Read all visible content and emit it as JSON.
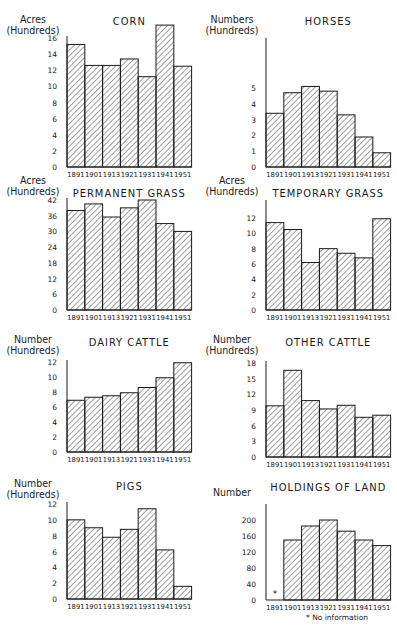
{
  "chart_data": [
    {
      "id": "corn",
      "type": "bar",
      "title": "CORN",
      "ylabel": [
        "Acres",
        "(Hundreds)"
      ],
      "xlabel": "",
      "categories": [
        "1891",
        "1901",
        "1913",
        "1921",
        "1931",
        "1941",
        "1951"
      ],
      "values": [
        15.2,
        12.6,
        12.6,
        13.4,
        11.2,
        17.6,
        12.5
      ],
      "yticks": [
        0,
        2,
        4,
        6,
        8,
        10,
        12,
        14,
        16
      ],
      "ylim": [
        0,
        16
      ],
      "grid": false,
      "legend": null
    },
    {
      "id": "horses",
      "type": "bar",
      "title": "HORSES",
      "ylabel": [
        "Numbers",
        "(Hundreds)"
      ],
      "xlabel": "",
      "categories": [
        "1891",
        "1901",
        "1913",
        "1921",
        "1931",
        "1941",
        "1951"
      ],
      "values": [
        3.4,
        4.7,
        5.1,
        4.8,
        3.3,
        1.9,
        0.9
      ],
      "yticks": [
        0,
        1,
        2,
        3,
        4,
        5
      ],
      "ylim": [
        0,
        5
      ],
      "grid": false,
      "legend": null
    },
    {
      "id": "permanent-grass",
      "type": "bar",
      "title": "PERMANENT GRASS",
      "ylabel": [
        "Acres",
        "(Hundreds)"
      ],
      "xlabel": "",
      "categories": [
        "1891",
        "1901",
        "1913",
        "1921",
        "1931",
        "1941",
        "1951"
      ],
      "values": [
        38,
        40.5,
        35.5,
        39,
        42,
        33,
        30
      ],
      "yticks": [
        0,
        6,
        12,
        18,
        24,
        30,
        36,
        42
      ],
      "ylim": [
        0,
        42
      ],
      "grid": false,
      "legend": null
    },
    {
      "id": "temporary-grass",
      "type": "bar",
      "title": "TEMPORARY GRASS",
      "ylabel": [
        "Acres",
        "(Hundreds)"
      ],
      "xlabel": "",
      "categories": [
        "1891",
        "1901",
        "1913",
        "1921",
        "1931",
        "1941",
        "1951"
      ],
      "values": [
        11.4,
        10.5,
        6.2,
        8.0,
        7.4,
        6.8,
        11.9
      ],
      "yticks": [
        0,
        2,
        4,
        6,
        8,
        10,
        12
      ],
      "ylim": [
        0,
        12
      ],
      "grid": false,
      "legend": null
    },
    {
      "id": "dairy-cattle",
      "type": "bar",
      "title": "DAIRY CATTLE",
      "ylabel": [
        "Number",
        "(Hundreds)"
      ],
      "xlabel": "",
      "categories": [
        "1891",
        "1901",
        "1913",
        "1921",
        "1931",
        "1941",
        "1951"
      ],
      "values": [
        6.9,
        7.3,
        7.5,
        7.9,
        8.6,
        9.9,
        11.9
      ],
      "yticks": [
        0,
        2,
        4,
        6,
        8,
        10,
        12
      ],
      "ylim": [
        0,
        12
      ],
      "grid": false,
      "legend": null
    },
    {
      "id": "other-cattle",
      "type": "bar",
      "title": "OTHER CATTLE",
      "ylabel": [
        "Number",
        "(Hundreds)"
      ],
      "xlabel": "",
      "categories": [
        "1891",
        "1901",
        "1913",
        "1921",
        "1931",
        "1941",
        "1951"
      ],
      "values": [
        9.8,
        16.6,
        10.8,
        9.2,
        9.9,
        7.6,
        8.0
      ],
      "yticks": [
        0,
        3,
        6,
        9,
        12,
        15,
        18
      ],
      "ylim": [
        0,
        18
      ],
      "grid": false,
      "legend": null
    },
    {
      "id": "pigs",
      "type": "bar",
      "title": "PIGS",
      "ylabel": [
        "Number",
        "(Hundreds)"
      ],
      "xlabel": "",
      "categories": [
        "1891",
        "1901",
        "1913",
        "1921",
        "1931",
        "1941",
        "1951"
      ],
      "values": [
        10.0,
        9.0,
        7.8,
        8.8,
        11.4,
        6.2,
        1.6
      ],
      "yticks": [
        0,
        2,
        4,
        6,
        8,
        10,
        12
      ],
      "ylim": [
        0,
        12
      ],
      "grid": false,
      "legend": null
    },
    {
      "id": "holdings-of-land",
      "type": "bar",
      "title": "HOLDINGS OF LAND",
      "ylabel": [
        "Number"
      ],
      "xlabel": "",
      "categories": [
        "1891",
        "1901",
        "1913",
        "1921",
        "1931",
        "1941",
        "1951"
      ],
      "values": [
        null,
        150,
        185,
        200,
        172,
        150,
        136
      ],
      "missing_marker": "*",
      "annotation": "* No information",
      "yticks": [
        0,
        40,
        80,
        120,
        160,
        200
      ],
      "ylim": [
        0,
        200
      ],
      "grid": false,
      "legend": null
    }
  ],
  "layout": {
    "panels": [
      {
        "left": 0,
        "top": 0,
        "axisTop": 36,
        "axisBottom": 167,
        "ylabTop": 14,
        "titleTop": 15
      },
      {
        "left": 199,
        "top": 0,
        "axisTop": 38,
        "axisBottom": 167,
        "ylabTop": 14,
        "titleTop": 15,
        "plotTop": 88
      },
      {
        "left": 0,
        "top": 170,
        "axisTop": 198,
        "axisBottom": 310,
        "ylabTop": 175,
        "titleTop": 187
      },
      {
        "left": 199,
        "top": 170,
        "axisTop": 200,
        "axisBottom": 310,
        "ylabTop": 175,
        "titleTop": 187,
        "plotTop": 218
      },
      {
        "left": 0,
        "top": 330,
        "axisTop": 360,
        "axisBottom": 452,
        "ylabTop": 334,
        "titleTop": 336
      },
      {
        "left": 199,
        "top": 330,
        "axisTop": 361,
        "axisBottom": 457,
        "ylabTop": 334,
        "titleTop": 336
      },
      {
        "left": 0,
        "top": 470,
        "axisTop": 502,
        "axisBottom": 599,
        "ylabTop": 478,
        "titleTop": 480
      },
      {
        "left": 199,
        "top": 470,
        "axisTop": 504,
        "axisBottom": 600,
        "ylabTop": 487,
        "titleTop": 481,
        "plotTop": 520
      }
    ]
  },
  "colors": {
    "ink": "#1a1a1a",
    "paper": "#ffffff",
    "hatch": "#2a2a2a"
  }
}
